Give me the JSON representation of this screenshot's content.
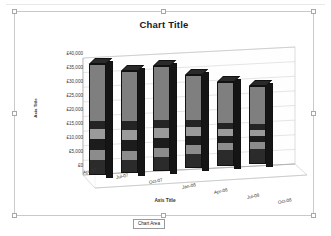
{
  "chart_title": "Chart Title",
  "tooltip": {
    "label": "Chart Area"
  },
  "axes": {
    "y_title": "Axis Title",
    "x_title": "Axis Title"
  },
  "chart_data": {
    "type": "bar",
    "subtype": "3d-stacked-column",
    "title": "Chart Title",
    "xlabel": "Axis Title",
    "ylabel": "Axis Title",
    "ylim": [
      0,
      40000
    ],
    "y_tick_labels": [
      "£40,000",
      "£35,000",
      "£30,000",
      "£25,000",
      "£20,000",
      "£15,000",
      "£10,000",
      "£5,000",
      "£0"
    ],
    "y_tick_values": [
      40000,
      35000,
      30000,
      25000,
      20000,
      15000,
      10000,
      5000,
      0
    ],
    "y_tick_prefix": "£",
    "grid": true,
    "legend": "none",
    "categories": [
      "Apr-07",
      "Jul-07",
      "Oct-07",
      "Jan-08",
      "Apr-08",
      "Jul-08",
      "Oct-08"
    ],
    "series": [
      {
        "name": "Series 1",
        "color": "#2b2b2b",
        "values": [
          4200,
          3900,
          4100,
          4600,
          4800,
          4500,
          0
        ]
      },
      {
        "name": "Series 2",
        "color": "#8c8c8c",
        "values": [
          3300,
          3100,
          3200,
          2900,
          2600,
          2400,
          0
        ]
      },
      {
        "name": "Series 3",
        "color": "#1c1c1c",
        "values": [
          3600,
          3500,
          3400,
          3000,
          2400,
          2100,
          0
        ]
      },
      {
        "name": "Series 4",
        "color": "#9a9a9a",
        "values": [
          3400,
          3200,
          3100,
          2800,
          2500,
          2300,
          0
        ]
      },
      {
        "name": "Series 5",
        "color": "#242424",
        "values": [
          3000,
          2900,
          2800,
          2500,
          2200,
          2000,
          0
        ]
      },
      {
        "name": "Series 6",
        "color": "#7f7f7f",
        "values": [
          18500,
          16400,
          17400,
          14200,
          12500,
          11700,
          0
        ]
      }
    ],
    "totals": [
      36000,
      33000,
      34000,
      30000,
      27000,
      25000,
      0
    ]
  },
  "bars": [
    {
      "category": "Apr-07",
      "total": 36000,
      "left": 74,
      "height": 111,
      "bottom": 50,
      "segments": [
        13,
        9,
        10,
        9,
        8,
        51
      ]
    },
    {
      "category": "Jul-07",
      "total": 33000,
      "left": 106,
      "height": 102,
      "bottom": 45,
      "segments": [
        12,
        9,
        11,
        10,
        9,
        49
      ]
    },
    {
      "category": "Oct-07",
      "total": 34000,
      "left": 138,
      "height": 105,
      "bottom": 40,
      "segments": [
        12,
        9,
        10,
        9,
        8,
        52
      ]
    },
    {
      "category": "Jan-08",
      "total": 30000,
      "left": 170,
      "height": 93,
      "bottom": 35,
      "segments": [
        15,
        10,
        10,
        9,
        8,
        48
      ]
    },
    {
      "category": "Apr-08",
      "total": 27000,
      "left": 202,
      "height": 84,
      "bottom": 29,
      "segments": [
        18,
        9,
        9,
        8,
        7,
        49
      ]
    },
    {
      "category": "Jul-08",
      "total": 25000,
      "left": 234,
      "height": 78,
      "bottom": 24,
      "segments": [
        19,
        9,
        8,
        8,
        7,
        49
      ]
    }
  ],
  "category_label_positions": [
    {
      "label": "Apr-07",
      "left": 68,
      "top": 158
    },
    {
      "label": "Jul-07",
      "left": 101,
      "top": 163
    },
    {
      "label": "Oct-07",
      "left": 134,
      "top": 168
    },
    {
      "label": "Jan-08",
      "left": 167,
      "top": 173
    },
    {
      "label": "Apr-08",
      "left": 199,
      "top": 178
    },
    {
      "label": "Jul-08",
      "left": 232,
      "top": 183
    },
    {
      "label": "Oct-08",
      "left": 263,
      "top": 188
    }
  ],
  "y_tick_positions": [
    {
      "label": "£40,000",
      "top": 39
    },
    {
      "label": "£35,000",
      "top": 53
    },
    {
      "label": "£30,000",
      "top": 67
    },
    {
      "label": "£25,000",
      "top": 81
    },
    {
      "label": "£20,000",
      "top": 95
    },
    {
      "label": "£15,000",
      "top": 109
    },
    {
      "label": "£10,000",
      "top": 123
    },
    {
      "label": "£5,000",
      "top": 137
    },
    {
      "label": "£0",
      "top": 151
    }
  ]
}
